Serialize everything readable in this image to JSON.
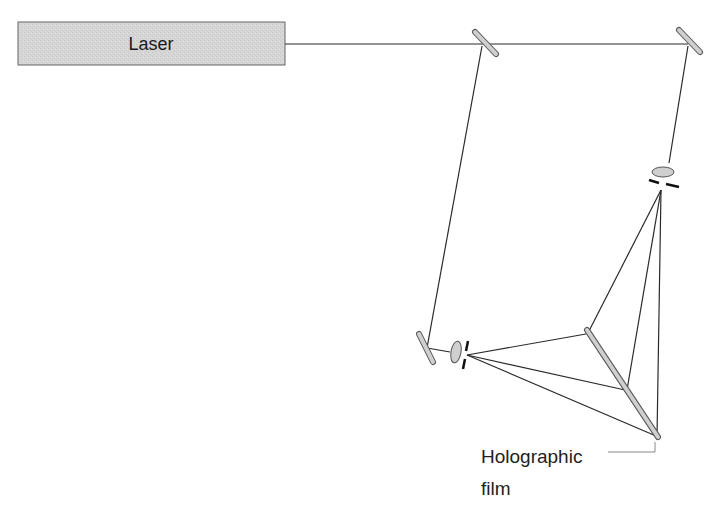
{
  "diagram": {
    "laser": {
      "label": "Laser",
      "fill": "#d4d4d4"
    },
    "film_label": {
      "line1": "Holographic",
      "line2": "film"
    },
    "components": [
      "laser",
      "beam-splitter",
      "mirror",
      "mirror",
      "lens",
      "pinhole",
      "lens",
      "pinhole",
      "object",
      "holographic-film"
    ],
    "colors": {
      "line": "#2a2a2a",
      "optic_fill": "#cfcfcf",
      "optic_stroke": "#555555"
    }
  }
}
